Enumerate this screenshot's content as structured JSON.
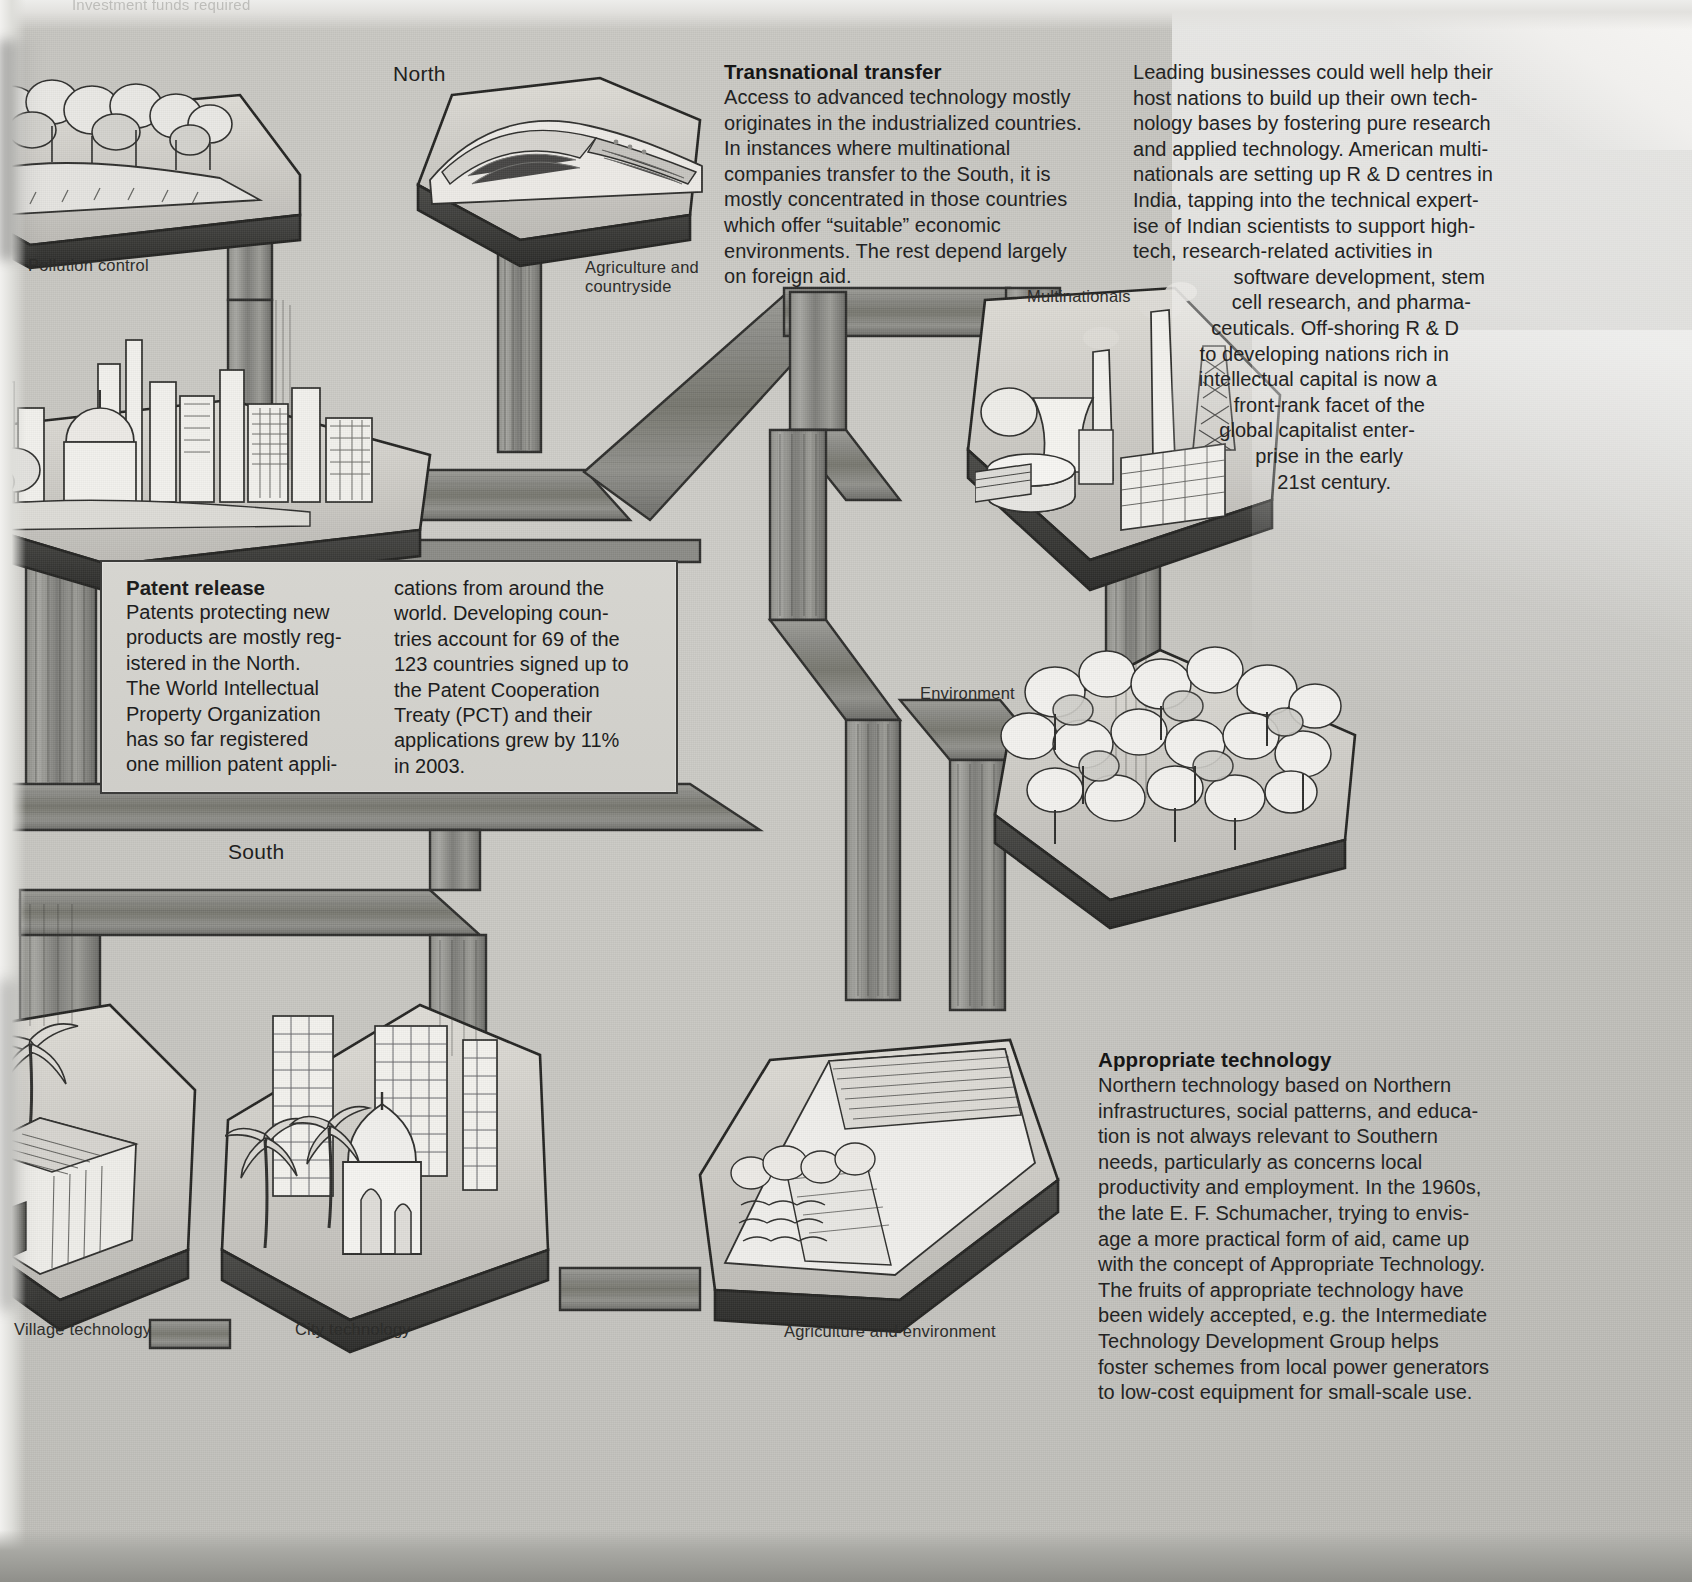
{
  "page": {
    "cropped_header_text": "Investment funds required",
    "background_color": "#c9c9c4"
  },
  "region_labels": {
    "north": "North",
    "south": "South"
  },
  "node_captions": [
    {
      "id": "pollution-control",
      "label": "Pollution control"
    },
    {
      "id": "agriculture-countryside",
      "label": "Agriculture and\ncountryside",
      "line1": "Agriculture and",
      "line2": "countryside"
    },
    {
      "id": "multinationals",
      "label": "Multinationals"
    },
    {
      "id": "environment",
      "label": "Environment"
    },
    {
      "id": "village-technology",
      "label": "Village technology"
    },
    {
      "id": "city-technology",
      "label": "City technology"
    },
    {
      "id": "agriculture-environment",
      "label": "Agriculture and environment"
    }
  ],
  "transnational": {
    "heading": "Transnational transfer",
    "body": "Access to advanced technology mostly originates in the industrialized countries. In instances where multinational companies transfer to the South, it is mostly concentrated in those countries which offer “suitable” economic environments. The rest depend largely on foreign aid."
  },
  "leading_businesses": {
    "body_block": "Leading businesses could well help their host nations to build up their own technology bases by fostering pure research and applied technology. American multinationals are setting up R & D centres in India, tapping into the technical expertise of Indian scientists to support high-tech, research-related activities in",
    "body_taper": "software development, stem cell research, and pharmaceuticals. Off-shoring R & D to developing nations rich in intellectual capital is now a front-rank facet of the global capitalist enterprise in the early 21st century.",
    "lines": [
      "Leading businesses could well help their",
      "host nations to build up their own tech-",
      "nology bases by fostering pure research",
      "and applied technology. American multi-",
      "nationals are setting up R & D centres in",
      "India, tapping into the technical expert-",
      "ise of Indian scientists to support high-",
      "tech, research-related activities in",
      "software development, stem",
      "cell research, and pharma-",
      "ceuticals. Off-shoring R & D",
      "to developing nations rich in",
      "intellectual capital is now a",
      "front-rank facet of the",
      "global capitalist enter-",
      "prise in the early",
      "21st century."
    ]
  },
  "patent_release": {
    "heading": "Patent release",
    "column_left": "Patents protecting new products are mostly registered in the North. The World Intellectual Property Organization has so far registered one million patent appli-",
    "column_right": "cations from around the world. Developing countries account for 69 of the 123 countries signed up to the Patent Cooperation Treaty (PCT) and their applications grew by 11% in 2003.",
    "left_lines": [
      "Patents protecting new",
      "products are mostly reg-",
      "istered in the North.",
      "The World Intellectual",
      "Property Organization",
      "has so far registered",
      "one million patent appli-"
    ],
    "right_lines": [
      "cations from around the",
      "world. Developing coun-",
      "tries account for 69 of the",
      "123 countries signed up to",
      "the Patent Cooperation",
      "Treaty (PCT) and their",
      "applications grew by 11%",
      "in 2003."
    ],
    "figures": {
      "developing_countries_in_pct": 69,
      "total_pct_countries": 123,
      "application_growth_percent": 11,
      "growth_year": 2003,
      "patent_applications_registered": "one million"
    }
  },
  "appropriate_technology": {
    "heading": "Appropriate technology",
    "body": "Northern technology based on Northern infrastructures, social patterns, and education is not always relevant to Southern needs, particularly as concerns local productivity and employment. In the 1960s, the late E. F. Schumacher, trying to envisage a more practical form of aid, came up with the concept of Appropriate Technology. The fruits of appropriate technology have been widely accepted, e.g. the Intermediate Technology Development Group helps foster schemes from local power generators to low-cost equipment for small-scale use.",
    "lines": [
      "Northern technology based on Northern",
      "infrastructures, social patterns, and educa-",
      "tion is not always relevant to Southern",
      "needs, particularly as concerns local",
      "productivity and employment. In the 1960s,",
      "the late E. F. Schumacher, trying to envis-",
      "age a more practical form of aid, came up",
      "with the concept of Appropriate Technology.",
      "The fruits of appropriate technology have",
      "been widely accepted, e.g. the Intermediate",
      "Technology Development Group helps",
      "foster schemes from local power generators",
      "to low-cost equipment for small-scale use."
    ]
  },
  "colors": {
    "paper": "#c9c9c4",
    "ink": "#232323",
    "pipe_dark": "#6f6f6b",
    "pipe_light": "#b6b6b1",
    "outline": "#2e2e2c"
  }
}
